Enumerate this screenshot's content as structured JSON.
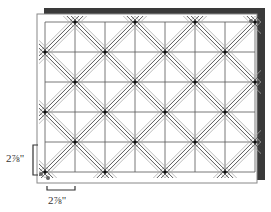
{
  "diagram": {
    "grid": {
      "columns": 7,
      "rows": 5,
      "origin_x": 45,
      "origin_y": 22,
      "cell_size_px": 30
    },
    "colors": {
      "board_shadow": "#3a3a3a",
      "board_edge": "#888888",
      "grid_line": "#555555",
      "diagonal_dark": "#444444",
      "diagonal_light": "#aaaaaa",
      "node": "#111111"
    },
    "dimensions": {
      "vertical_label": "2⅞\"",
      "horizontal_label": "2⅞\""
    }
  }
}
